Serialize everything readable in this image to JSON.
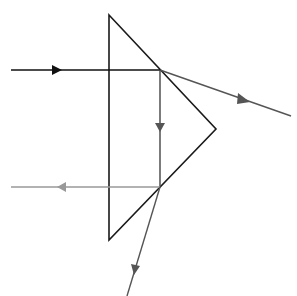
{
  "diagram": {
    "colors": {
      "prism": "#1a1a1a",
      "incident_ray": "#111111",
      "refracted_ray": "#555555",
      "internal_ray": "#444444",
      "reflected_back_ray": "#999999",
      "bottom_exit_ray": "#555555"
    },
    "prism": {
      "vertices": [
        [
          109,
          15
        ],
        [
          216,
          129
        ],
        [
          109,
          240
        ]
      ]
    },
    "rays": [
      {
        "name": "incident",
        "from": [
          11,
          70
        ],
        "to": [
          160,
          70
        ],
        "arrow_at": [
          57,
          70
        ],
        "direction": "right"
      },
      {
        "name": "refracted-out-upper",
        "from": [
          160,
          70
        ],
        "to": [
          291,
          116
        ],
        "arrow_at": [
          245,
          100
        ],
        "direction": "down-right"
      },
      {
        "name": "internal-reflected",
        "from": [
          160,
          70
        ],
        "to": [
          160,
          187
        ],
        "arrow_at": [
          160,
          128
        ],
        "direction": "down"
      },
      {
        "name": "reflected-back",
        "from": [
          160,
          187
        ],
        "to": [
          11,
          187
        ],
        "arrow_at": [
          62,
          187
        ],
        "direction": "left"
      },
      {
        "name": "refracted-out-lower",
        "from": [
          160,
          187
        ],
        "to": [
          127,
          296
        ],
        "arrow_at": [
          135,
          270
        ],
        "direction": "down-left"
      }
    ]
  }
}
